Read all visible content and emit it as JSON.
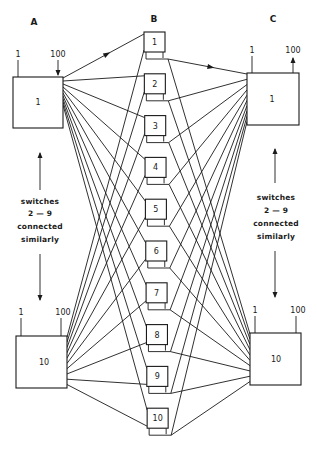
{
  "columns": {
    "a": "A",
    "b": "B",
    "c": "C"
  },
  "switches_a": [
    {
      "label": "1",
      "terminal_first": "1",
      "terminal_last": "100"
    },
    {
      "label": "10",
      "terminal_first": "1",
      "terminal_last": "100"
    }
  ],
  "switches_b": [
    "1",
    "2",
    "3",
    "4",
    "5",
    "6",
    "7",
    "8",
    "9",
    "10"
  ],
  "switches_c": [
    {
      "label": "1",
      "terminal_first": "1",
      "terminal_last": "100"
    },
    {
      "label": "10",
      "terminal_first": "1",
      "terminal_last": "100"
    }
  ],
  "notes": {
    "left": [
      "switches",
      "2 — 9",
      "connected",
      "similarly"
    ],
    "right": [
      "switches",
      "2 — 9",
      "connected",
      "similarly"
    ]
  },
  "colors": {
    "ink": "#1a1a1a",
    "background": "#ffffff"
  }
}
